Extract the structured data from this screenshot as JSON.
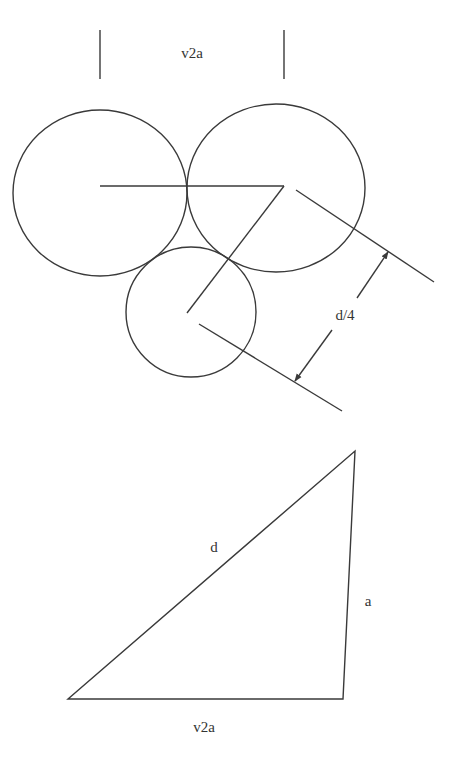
{
  "diagram": {
    "top_figure": {
      "dimension_label_top": "v2a",
      "dimension_label_side": "d/4",
      "circles": [
        {
          "name": "left-circle",
          "cx": 100,
          "cy": 193,
          "rx": 87,
          "ry": 83
        },
        {
          "name": "right-circle",
          "cx": 276,
          "cy": 188,
          "rx": 89,
          "ry": 84
        },
        {
          "name": "bottom-circle",
          "cx": 191,
          "cy": 312,
          "rx": 65,
          "ry": 65
        }
      ]
    },
    "bottom_figure": {
      "hypotenuse_label": "d",
      "vertical_side_label": "a",
      "base_label": "v2a"
    },
    "colors": {
      "line": "#3a3a3a",
      "text": "#333333",
      "background": "#ffffff"
    }
  }
}
